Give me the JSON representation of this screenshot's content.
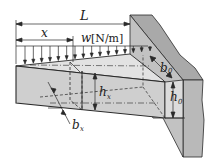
{
  "figure": {
    "type": "cantilever-beam-tapered",
    "labels": {
      "length": "L",
      "position": "x",
      "load_symbol": "w",
      "load_unit": "[N/m]",
      "width_root": "b",
      "width_root_sub": "0",
      "height_root": "h",
      "height_root_sub": "0",
      "height_x": "h",
      "height_x_sub": "x",
      "width_x": "b",
      "width_x_sub": "x"
    },
    "colors": {
      "beam_face": "#cfcfcf",
      "beam_top": "#e2e2e2",
      "wall": "#b9b9b9",
      "wall_side": "#a9a9a9",
      "line": "#2a2a2a"
    },
    "load_arrow_count": 16
  }
}
